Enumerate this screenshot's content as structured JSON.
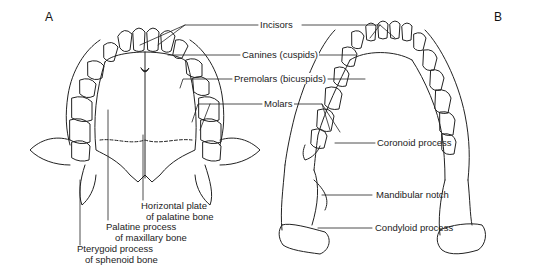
{
  "figure": {
    "panels": [
      {
        "id": "A",
        "letter": "A",
        "subject": "maxilla (upper jaw) viewed from below"
      },
      {
        "id": "B",
        "letter": "B",
        "subject": "mandible (lower jaw) viewed from above"
      }
    ],
    "center_labels": {
      "incisors": "Incisors",
      "canines": "Canines (cuspids)",
      "premolars": "Premolars (bicuspids)",
      "molars": "Molars"
    },
    "panel_a_labels": {
      "horizontal_plate_line1": "Horizontal plate",
      "horizontal_plate_line2": "of palatine bone",
      "palatine_process_line1": "Palatine process",
      "palatine_process_line2": "of maxillary bone",
      "pterygoid_line1": "Pterygoid process",
      "pterygoid_line2": "of sphenoid bone"
    },
    "panel_b_labels": {
      "coronoid": "Coronoid process",
      "mandibular_notch": "Mandibular notch",
      "condyloid": "Condyloid process"
    },
    "colors": {
      "ink": "#222222",
      "background": "#ffffff"
    }
  }
}
